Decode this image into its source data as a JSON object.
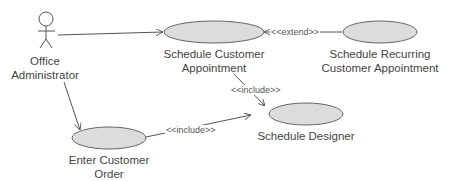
{
  "diagram": {
    "type": "uml-use-case",
    "colors": {
      "line": "#555555",
      "ellipse_fill": "#dcdcdc",
      "ellipse_stroke": "#666666",
      "text": "#444444"
    },
    "actor": {
      "label_line1": "Office",
      "label_line2": "Administrator"
    },
    "use_cases": [
      {
        "id": "sca",
        "line1": "Schedule Customer",
        "line2": "Appointment"
      },
      {
        "id": "srca",
        "line1": "Schedule Recurring",
        "line2": "Customer Appointment"
      },
      {
        "id": "sd",
        "line1": "Schedule Designer",
        "line2": ""
      },
      {
        "id": "eco",
        "line1": "Enter Customer",
        "line2": "Order"
      }
    ],
    "relationships": [
      {
        "from": "actor",
        "to": "sca",
        "kind": "association",
        "label": ""
      },
      {
        "from": "actor",
        "to": "eco",
        "kind": "association",
        "label": ""
      },
      {
        "from": "srca",
        "to": "sca",
        "kind": "extend",
        "label": "<<extend>>"
      },
      {
        "from": "sca",
        "to": "sd",
        "kind": "include",
        "label": "<<include>>"
      },
      {
        "from": "eco",
        "to": "sd",
        "kind": "include",
        "label": "<<include>>"
      }
    ]
  }
}
